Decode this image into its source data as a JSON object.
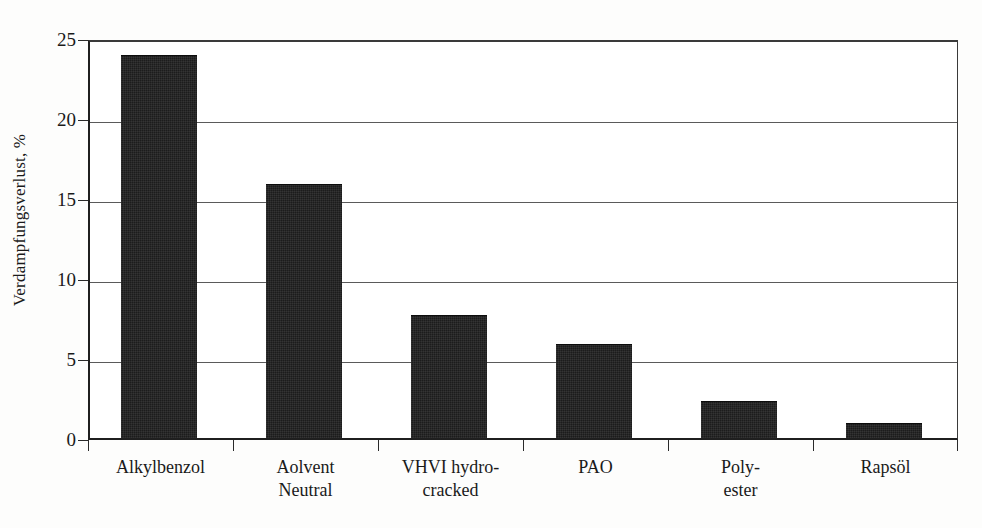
{
  "chart_data": {
    "type": "bar",
    "title": "",
    "xlabel": "",
    "ylabel": "Verdampfungsverlust, %",
    "categories": [
      "Alkylbenzol",
      "Aolvent Neutral",
      "VHVI hydro-cracked",
      "PAO",
      "Poly-ester",
      "Rapsöl"
    ],
    "category_lines": [
      [
        "Alkylbenzol"
      ],
      [
        "Aolvent",
        "Neutral"
      ],
      [
        "VHVI hydro-",
        "cracked"
      ],
      [
        "PAO"
      ],
      [
        "Poly-",
        "ester"
      ],
      [
        "Rapsöl"
      ]
    ],
    "values": [
      24.1,
      16.0,
      7.7,
      5.9,
      2.3,
      0.9
    ],
    "ylim": [
      0,
      25
    ],
    "yticks": [
      0,
      5,
      10,
      15,
      20,
      25
    ],
    "ytick_labels": [
      "0",
      "5",
      "10",
      "15",
      "20",
      "25"
    ],
    "grid": true,
    "legend": false,
    "bar_color": "#1c1c1c",
    "axis_color": "#1f1f1f",
    "grid_color": "#5a5a5a",
    "background_color": "#ffffff"
  }
}
